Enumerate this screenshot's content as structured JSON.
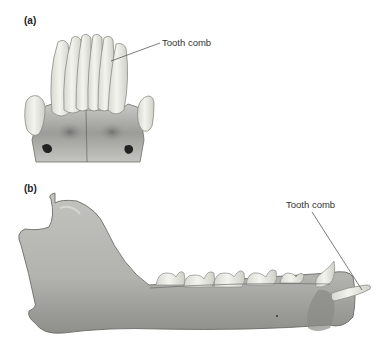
{
  "figure": {
    "panels": [
      {
        "id": "a",
        "label": "(a)",
        "view": "front view of lower incisors and canines",
        "callout": "Tooth comb"
      },
      {
        "id": "b",
        "label": "(b)",
        "view": "lateral view of mandible",
        "callout": "Tooth comb"
      }
    ],
    "colors": {
      "bone": "#b9b9b5",
      "bone_shadow": "#8a8a86",
      "tooth": "#ecece6",
      "tooth_edge": "#9a9a94",
      "leader_line": "#444444"
    }
  }
}
